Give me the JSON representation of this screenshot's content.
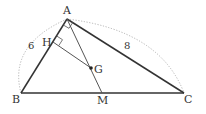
{
  "diagram": {
    "type": "geometry",
    "colors": {
      "line": "#333333",
      "thin_line": "#555555",
      "arc": "#aaaaaa",
      "background": "#ffffff"
    },
    "points": {
      "A": {
        "label": "A",
        "x": 67,
        "y": 19
      },
      "B": {
        "label": "B",
        "x": 21,
        "y": 93
      },
      "C": {
        "label": "C",
        "x": 184,
        "y": 93
      },
      "M": {
        "label": "M",
        "x": 102,
        "y": 93
      },
      "G": {
        "label": "G",
        "x": 91,
        "y": 68
      },
      "H": {
        "label": "H",
        "x": 53,
        "y": 42
      }
    },
    "segments": [
      {
        "from": "A",
        "to": "B",
        "style": "bold"
      },
      {
        "from": "A",
        "to": "C",
        "style": "bold"
      },
      {
        "from": "B",
        "to": "C",
        "style": "bold"
      },
      {
        "from": "A",
        "to": "M",
        "style": "thin"
      },
      {
        "from": "H",
        "to": "G",
        "style": "thin"
      }
    ],
    "right_angle_marks": [
      {
        "at": "A",
        "between": [
          "B",
          "C"
        ]
      },
      {
        "at": "H",
        "between": [
          "A",
          "G"
        ]
      }
    ],
    "length_labels": [
      {
        "segment": "AB",
        "text": "6"
      },
      {
        "segment": "AC",
        "text": "8"
      }
    ],
    "dotted_arcs": [
      {
        "over": "AB"
      },
      {
        "over": "AC"
      }
    ]
  }
}
